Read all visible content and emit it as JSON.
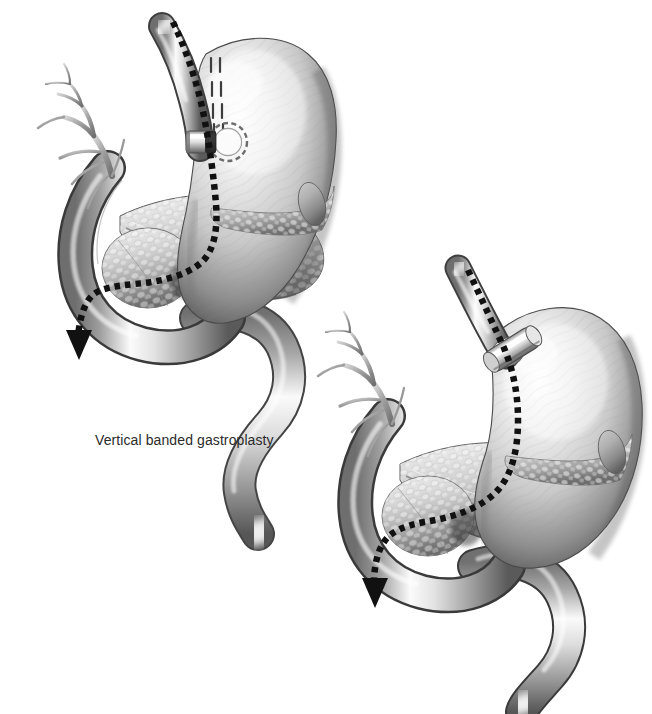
{
  "figure": {
    "kind": "medical-illustration",
    "style": "grayscale-airbrush-anatomical",
    "background_color": "#ffffff",
    "caption": {
      "text": "Vertical banded gastroplasty",
      "color": "#2b2b2b",
      "x": 95,
      "y": 431,
      "font_size_px": 14
    },
    "palette": {
      "ink": "#1a1a1a",
      "organ_light": "#f2f2f2",
      "organ_mid": "#b9b9b9",
      "organ_dark": "#5d5d5d",
      "organ_shadow": "#2e2e2e",
      "highlight": "#ffffff",
      "dotted_path": "#111111",
      "band_metal": "#d8d8d8"
    },
    "panels": [
      {
        "id": "panel-vertical-banded-gastroplasty",
        "label": "Vertical banded gastroplasty",
        "position": "upper-left",
        "has_caption": true,
        "bounds": {
          "x": 18,
          "y": 22,
          "width": 320,
          "height": 400
        },
        "structures": [
          {
            "name": "esophagus",
            "label": "Esophagus"
          },
          {
            "name": "gastric-pouch",
            "label": "Gastric pouch"
          },
          {
            "name": "staple-line",
            "label": "Vertical staple line"
          },
          {
            "name": "band-collar",
            "label": "Polypropylene band collar"
          },
          {
            "name": "stoma-ring",
            "label": "Stoma outlet ring"
          },
          {
            "name": "stomach-body",
            "label": "Stomach body"
          },
          {
            "name": "greater-curvature",
            "label": "Greater curvature"
          },
          {
            "name": "duodenum",
            "label": "Duodenum"
          },
          {
            "name": "pancreas",
            "label": "Pancreas"
          },
          {
            "name": "pancreatic-duct",
            "label": "Pancreatic duct"
          },
          {
            "name": "biliary-tree",
            "label": "Biliary tree"
          },
          {
            "name": "jejunum",
            "label": "Jejunum"
          },
          {
            "name": "flow-arrow",
            "label": "Food flow pathway"
          }
        ]
      },
      {
        "id": "panel-adjustable-gastric-band",
        "label": "Adjustable gastric band",
        "position": "lower-right",
        "has_caption": false,
        "bounds": {
          "x": 330,
          "y": 262,
          "width": 312,
          "height": 440
        },
        "structures": [
          {
            "name": "esophagus",
            "label": "Esophagus"
          },
          {
            "name": "gastric-band",
            "label": "Adjustable gastric band"
          },
          {
            "name": "gastric-pouch",
            "label": "Small gastric pouch"
          },
          {
            "name": "stomach-body",
            "label": "Stomach body"
          },
          {
            "name": "greater-curvature",
            "label": "Greater curvature"
          },
          {
            "name": "duodenum",
            "label": "Duodenum"
          },
          {
            "name": "pancreas",
            "label": "Pancreas"
          },
          {
            "name": "pancreatic-duct",
            "label": "Pancreatic duct"
          },
          {
            "name": "biliary-tree",
            "label": "Biliary tree"
          },
          {
            "name": "jejunum",
            "label": "Jejunum"
          },
          {
            "name": "flow-arrow",
            "label": "Food flow pathway"
          }
        ]
      }
    ]
  }
}
